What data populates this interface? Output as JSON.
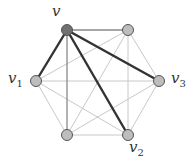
{
  "graph": {
    "nodes": [
      {
        "id": "v",
        "x": 67,
        "y": 30,
        "label": "v",
        "sub": "",
        "fill": "#707070"
      },
      {
        "id": "t",
        "x": 128,
        "y": 30,
        "label": "",
        "sub": "",
        "fill": "#bdbdbd"
      },
      {
        "id": "v3",
        "x": 159,
        "y": 81,
        "label": "v",
        "sub": "3",
        "fill": "#bdbdbd"
      },
      {
        "id": "v2",
        "x": 128,
        "y": 135,
        "label": "v",
        "sub": "2",
        "fill": "#bdbdbd"
      },
      {
        "id": "b",
        "x": 67,
        "y": 135,
        "label": "",
        "sub": "",
        "fill": "#bdbdbd"
      },
      {
        "id": "v1",
        "x": 36,
        "y": 81,
        "label": "v",
        "sub": "1",
        "fill": "#bdbdbd"
      }
    ],
    "highlight_edges": [
      [
        "v",
        "v1"
      ],
      [
        "v",
        "v3"
      ],
      [
        "v",
        "v2"
      ]
    ],
    "mid_edges": [
      [
        "v",
        "t"
      ],
      [
        "v",
        "b"
      ]
    ],
    "colors": {
      "light": "#c8c8c8",
      "mid": "#8a8a8a",
      "thick": "#333333"
    }
  },
  "labels": {
    "v": {
      "text": "v",
      "sub": ""
    },
    "v1": {
      "text": "v",
      "sub": "1"
    },
    "v2": {
      "text": "v",
      "sub": "2"
    },
    "v3": {
      "text": "v",
      "sub": "3"
    }
  }
}
